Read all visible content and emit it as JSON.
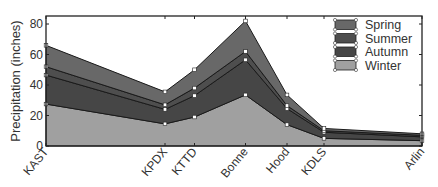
{
  "chart_data": {
    "type": "area",
    "stacked": true,
    "title": "",
    "xlabel": "",
    "ylabel": "Precipitation (inches)",
    "ylim": [
      0,
      85
    ],
    "yticks": [
      0,
      20,
      40,
      60,
      80
    ],
    "grid": false,
    "legend_position": "upper right",
    "categories": [
      "KAST",
      "KPDX",
      "KTTD",
      "Bonne",
      "Hood",
      "KDLS",
      "Arlin"
    ],
    "x_positions_px": [
      46,
      165,
      194.5,
      245.5,
      287,
      324,
      422
    ],
    "series": [
      {
        "name": "Winter",
        "color": "#a0a0a0",
        "values": [
          27.5,
          14.5,
          19,
          33.5,
          14,
          5,
          3.5
        ]
      },
      {
        "name": "Autumn",
        "color": "#464646",
        "values": [
          19,
          9.5,
          14,
          23,
          10.5,
          4,
          2.5
        ]
      },
      {
        "name": "Summer",
        "color": "#4e4e4e",
        "values": [
          5.5,
          3,
          5,
          5.5,
          2,
          1,
          1
        ]
      },
      {
        "name": "Spring",
        "color": "#686868",
        "values": [
          14,
          8.5,
          12,
          20,
          7,
          1.5,
          1
        ]
      }
    ],
    "cumulative_tops": {
      "Winter": [
        27.5,
        14.5,
        19,
        33.5,
        14,
        5,
        3.5
      ],
      "Autumn": [
        46.5,
        24,
        33,
        56.5,
        24.5,
        9,
        6
      ],
      "Summer": [
        52,
        27,
        38,
        62,
        26.5,
        10,
        7
      ],
      "Spring": [
        66,
        35.5,
        50,
        82,
        33.5,
        11.5,
        8
      ]
    },
    "legend": [
      "Spring",
      "Summer",
      "Autumn",
      "Winter"
    ]
  }
}
